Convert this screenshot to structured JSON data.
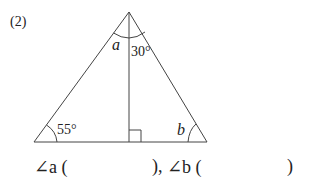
{
  "problem": {
    "number": "(2)",
    "angles": {
      "a_label": "a",
      "top_known": "30°",
      "left_known": "55°",
      "b_label": "b"
    },
    "answer_line": {
      "a_prefix": "∠a (",
      "a_suffix": "),",
      "b_prefix": "∠b (",
      "b_suffix": ")"
    }
  }
}
